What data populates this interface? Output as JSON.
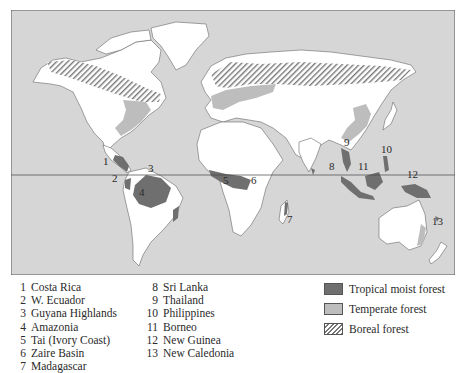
{
  "map": {
    "title": "World distribution of forest types",
    "equator_shown": true,
    "colors": {
      "ocean": "#d6d6d6",
      "land": "#ffffff",
      "tropical_moist_forest": "#6f6f6f",
      "temperate_forest": "#bdbdbd",
      "boreal_forest_hatch": "#777777",
      "frame": "#555555"
    },
    "labels": [
      "1",
      "2",
      "3",
      "4",
      "5",
      "6",
      "7",
      "8",
      "9",
      "10",
      "11",
      "12",
      "13"
    ]
  },
  "sites_left": [
    {
      "num": "1",
      "name": "Costa Rica"
    },
    {
      "num": "2",
      "name": "W. Ecuador"
    },
    {
      "num": "3",
      "name": "Guyana Highlands"
    },
    {
      "num": "4",
      "name": "Amazonia"
    },
    {
      "num": "5",
      "name": "Tai (Ivory Coast)"
    },
    {
      "num": "6",
      "name": "Zaire Basin"
    },
    {
      "num": "7",
      "name": "Madagascar"
    }
  ],
  "sites_right": [
    {
      "num": "8",
      "name": "Sri Lanka"
    },
    {
      "num": "9",
      "name": "Thailand"
    },
    {
      "num": "10",
      "name": "Philippines"
    },
    {
      "num": "11",
      "name": "Borneo"
    },
    {
      "num": "12",
      "name": "New Guinea"
    },
    {
      "num": "13",
      "name": "New Caledonia"
    }
  ],
  "legend": [
    {
      "key": "tropical",
      "label": "Tropical moist forest"
    },
    {
      "key": "temperate",
      "label": "Temperate forest"
    },
    {
      "key": "boreal",
      "label": "Boreal forest"
    }
  ]
}
